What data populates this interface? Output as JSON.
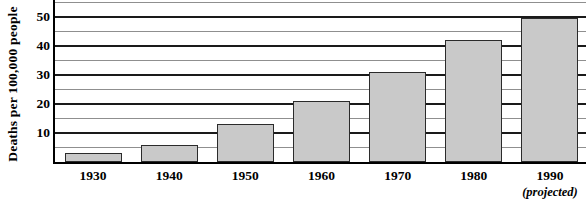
{
  "chart_data": {
    "type": "bar",
    "title": "",
    "xlabel": "",
    "ylabel": "Deaths per 100,000 people",
    "categories": [
      "1930",
      "1940",
      "1950",
      "1960",
      "1970",
      "1980",
      "1990"
    ],
    "category_sublabels": [
      "",
      "",
      "",
      "",
      "",
      "",
      "(projected)"
    ],
    "values": [
      3,
      6,
      13,
      21,
      31,
      42,
      49.5
    ],
    "ylim": [
      0,
      55
    ],
    "y_major_ticks": [
      10,
      20,
      30,
      40,
      50
    ],
    "y_tick_labels": [
      "10",
      "20",
      "30",
      "40",
      "50"
    ],
    "y_minor_ticks": [
      5,
      15,
      25,
      35,
      45,
      55
    ],
    "grid": true,
    "legend": false,
    "bar_fill_color": "#c9c9c9",
    "bar_border_color": "#2b2b2b",
    "major_gridline_color": "#1a1a1a",
    "minor_gridline_color": "#8f8f8f",
    "axis_color": "#000000",
    "background_color": "#ffffff"
  }
}
